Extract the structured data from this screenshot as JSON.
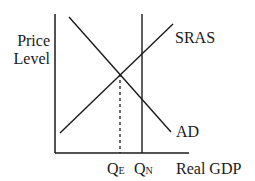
{
  "diagram": {
    "title": "",
    "y_axis_label_line1": "Price",
    "y_axis_label_line2": "Level",
    "x_axis_label": "Real GDP",
    "curves": {
      "sras": "SRAS",
      "ad": "AD"
    },
    "quantities": {
      "qe_main": "Q",
      "qe_sub": "E",
      "qn_main": "Q",
      "qn_sub": "N"
    },
    "colors": {
      "line": "#1a1a1a",
      "background": "#ffffff"
    }
  }
}
